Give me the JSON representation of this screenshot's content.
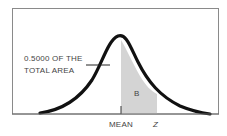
{
  "diagram": {
    "type": "normal-distribution-curve",
    "annotation_line1": "0.5000 OF THE",
    "annotation_line2": "TOTAL AREA",
    "shaded_region_label": "B",
    "axis_labels": {
      "mean": "MEAN",
      "z": "Z"
    },
    "colors": {
      "curve": "#111111",
      "shade": "#d4d4d4",
      "frame": "#888888"
    }
  }
}
